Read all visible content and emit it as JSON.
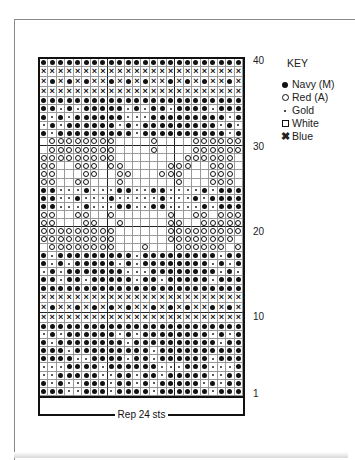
{
  "chart": {
    "columns": 24,
    "rows": 40,
    "repeat_label": "Rep 24 sts",
    "row_labels": [
      {
        "label": "40",
        "row": 40
      },
      {
        "label": "30",
        "row": 30
      },
      {
        "label": "20",
        "row": 20
      },
      {
        "label": "10",
        "row": 10
      },
      {
        "label": "1",
        "row": 1
      }
    ],
    "grid_top_to_bottom": [
      "NNNNNNNNNNNNNNNNNNNNNNNN",
      "BBBBBBBBBBBBBBBBBBBBBBBB",
      "BNBNBNBBNBNBNBBNBNBNBBNB",
      "BBBBBBBBBBBBBBBBBBBBBBBB",
      "NNNNNNNNNNNNNNNNNNNNNNNN",
      "NNGNGNNNNNGNGNNGNNNNGNNN",
      "NGNGNNNNNNGGGNNNNNNNNNGN",
      "GNGNNNNNNGNGNNNNNNNNNGNG",
      "NGNNNNNNNNNGNNNNNNNNNNGN",
      "WRRRRRRRRWWWWRWWWWRRRRRR",
      "WRRRRRRRRWWWWRWWWWRRRRRR",
      "RRRRRRRRRWWWWWWWWRRRRRRW",
      "RRWWRRRWRRWWWWWRRRWWRRRW",
      "RRWWWRRWWRRWWWRRRWWWRRRW",
      "RRWWRRWWWRWWWWWWRWWWRRRW",
      "NNGGGNGGGNNGGNNGGGGNGNNN",
      "NNGGNGGGNGGGGGNGGGNGNNNN",
      "NNGGGNGGGNNGGNNGGGGNGNNN",
      "RRWWRRWWRWWWWWWRWWRRWRRR",
      "RRWWWRRWWRWWWWWRRWWRRRRR",
      "RRRRRRRRRWWWWWWRRRRRRRRR",
      "RRRRRRRRRWWWWWWRRRRRRRRW",
      "WRRRRRRRRWWWRWWWRRRRRRWR",
      "NGNNNNNNNNNGNNNNNNNNNGNN",
      "NGNGNNNNNGNGNNNNNNNNGNGN",
      "GNGNNNNNNNGGGNNNNNNNNGNG",
      "NNGNNGNNNNNGNNGNNNNNGNNN",
      "NNNNNNNNNNNNNNNNNNNNNNNN",
      "BBBBBBBBBBBBBBBBBBBBBBBB",
      "BNBBNBNBNBNBBNBNBNBBNBNB",
      "BBBBBBBBBBBBBBBBBBBBBBBB",
      "NNNNNNNNNNNNNNNNNNNNNNNN",
      "GNGNNNNNNGNGNNNNNNNNGNGN",
      "NGNNNNNNNNGNNNNNNNNNNGNN",
      "NNNGNNNNNNNNNGNNNNNNNNNN",
      "NNNNGGNNNNGNNGNNNNNNGNNN",
      "RRWWWRRRRRWRWWRRRRRWWRRW",
      "WWWWRWWRRRRRWRRRRRRWRWWR",
      "RRWWWWRRRRRWWRRRRRRWWRRW",
      "NNNNGGNNNNGNNNGNNNNNGNNN"
    ],
    "grid_bottom_rows_1_to_4": [
      "GGGNNNNGNNNNNNGGGNNNGGGN",
      "GGNNNNNGGNNGNNGNNNNNGGNN",
      "NGNGGNNNGNNGNGNNNNNGNGNN",
      "NNNGGNNNGNNNNGNNNNNNGNNN"
    ]
  },
  "key": {
    "title": "KEY",
    "items": [
      {
        "symbol": "N",
        "label": "Navy (M)"
      },
      {
        "symbol": "R",
        "label": "Red (A)"
      },
      {
        "symbol": "G",
        "label": "Gold"
      },
      {
        "symbol": "W",
        "label": "White"
      },
      {
        "symbol": "B",
        "label": "Blue"
      }
    ]
  }
}
